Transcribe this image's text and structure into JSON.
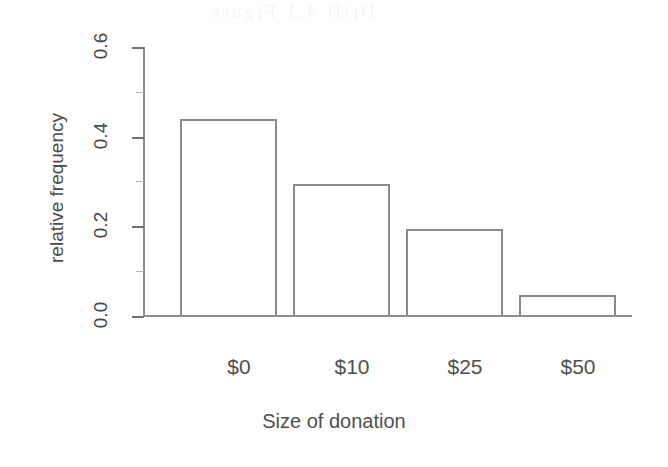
{
  "chart_data": {
    "type": "bar",
    "title": "",
    "xlabel": "Size of donation",
    "ylabel": "relative frequency",
    "categories": [
      "$0",
      "$10",
      "$25",
      "$50"
    ],
    "values": [
      0.44,
      0.295,
      0.195,
      0.047
    ],
    "ylim": [
      0.0,
      0.6
    ],
    "ytick_labels": [
      "0.0",
      "0.2",
      "0.4",
      "0.6"
    ],
    "ytick_values": [
      0.0,
      0.2,
      0.4,
      0.6
    ],
    "yminor_tick_values": [
      0.1,
      0.3,
      0.5
    ],
    "grid": false,
    "legend": null,
    "bar_fill": "#ffffff",
    "bar_edge_color": "#8a8a8a",
    "axis_color": "#8d8d8d",
    "background": "#ffffff",
    "orientation": "vertical"
  },
  "axes": {
    "y_title": "relative frequency",
    "x_title": "Size of donation",
    "y_labels": {
      "t0": "0.0",
      "t1": "0.2",
      "t2": "0.4",
      "t3": "0.6"
    },
    "x_labels": {
      "c0": "$0",
      "c1": "$10",
      "c2": "$25",
      "c3": "$50"
    }
  },
  "artifacts": {
    "bleed_text": "Drill 4.1 Figure"
  }
}
